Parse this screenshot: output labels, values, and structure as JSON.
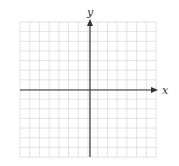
{
  "diagram": {
    "type": "cartesian-coordinate-grid",
    "x_axis_label": "x",
    "y_axis_label": "y",
    "grid": {
      "left": 20,
      "top": 22,
      "right": 156,
      "bottom": 157,
      "cols": 14,
      "rows": 14
    },
    "origin": {
      "x": 90,
      "y": 90
    },
    "colors": {
      "grid": "#dcdcdc",
      "axis": "#333333",
      "background": "#ffffff"
    }
  }
}
